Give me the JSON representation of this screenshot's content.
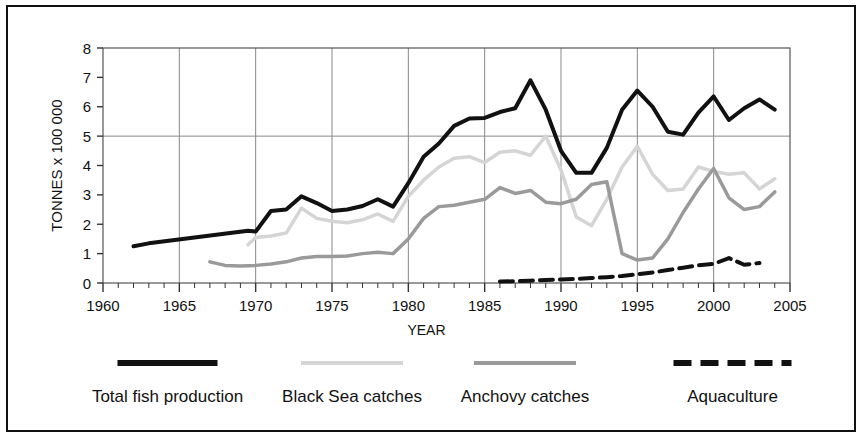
{
  "figure": {
    "border_color": "#111111",
    "background": "#ffffff"
  },
  "chart_data": {
    "type": "line",
    "title": "",
    "xlabel": "YEAR",
    "ylabel": "TONNES x 100 000",
    "xlim": [
      1960,
      2005
    ],
    "ylim": [
      0,
      8
    ],
    "xticks": [
      1960,
      1965,
      1970,
      1975,
      1980,
      1985,
      1990,
      1995,
      2000,
      2005
    ],
    "xtick_labels": [
      "1960",
      "1965",
      "1970",
      "1975",
      "1980",
      "1985",
      "1990",
      "1995",
      "2000",
      "2005"
    ],
    "x_minor_tick_step": 1,
    "yticks": [
      0,
      1,
      2,
      3,
      4,
      5,
      6,
      7,
      8
    ],
    "ytick_labels": [
      "0",
      "1",
      "2",
      "3",
      "4",
      "5",
      "6",
      "7",
      "8"
    ],
    "grid": {
      "vertical_at": [
        1965,
        1970,
        1975,
        1980,
        1985,
        1990,
        1995,
        2000
      ],
      "horizontal_at": [
        5
      ],
      "color": "#888888"
    },
    "legend_position": "below-plot",
    "series": [
      {
        "name": "Total fish production",
        "color": "#111111",
        "style": "solid",
        "width": 4,
        "points": [
          [
            1962,
            1.25
          ],
          [
            1963,
            1.35
          ],
          [
            1969.5,
            1.78
          ],
          [
            1970,
            1.75
          ],
          [
            1971,
            2.45
          ],
          [
            1972,
            2.5
          ],
          [
            1973,
            2.95
          ],
          [
            1974,
            2.72
          ],
          [
            1975,
            2.45
          ],
          [
            1976,
            2.5
          ],
          [
            1977,
            2.62
          ],
          [
            1978,
            2.85
          ],
          [
            1979,
            2.6
          ],
          [
            1980,
            3.4
          ],
          [
            1981,
            4.3
          ],
          [
            1982,
            4.75
          ],
          [
            1983,
            5.35
          ],
          [
            1984,
            5.6
          ],
          [
            1985,
            5.62
          ],
          [
            1986,
            5.82
          ],
          [
            1987,
            5.95
          ],
          [
            1988,
            6.9
          ],
          [
            1989,
            5.9
          ],
          [
            1990,
            4.5
          ],
          [
            1991,
            3.75
          ],
          [
            1992,
            3.75
          ],
          [
            1993,
            4.6
          ],
          [
            1994,
            5.9
          ],
          [
            1995,
            6.55
          ],
          [
            1996,
            6.0
          ],
          [
            1997,
            5.15
          ],
          [
            1998,
            5.05
          ],
          [
            1999,
            5.8
          ],
          [
            2000,
            6.35
          ],
          [
            2001,
            5.55
          ],
          [
            2002,
            5.95
          ],
          [
            2003,
            6.25
          ],
          [
            2004,
            5.9
          ]
        ]
      },
      {
        "name": "Black Sea catches",
        "color": "#d5d5d5",
        "style": "solid",
        "width": 3.5,
        "points": [
          [
            1969.5,
            1.3
          ],
          [
            1970,
            1.55
          ],
          [
            1971,
            1.6
          ],
          [
            1972,
            1.7
          ],
          [
            1973,
            2.55
          ],
          [
            1974,
            2.2
          ],
          [
            1975,
            2.1
          ],
          [
            1976,
            2.05
          ],
          [
            1977,
            2.15
          ],
          [
            1978,
            2.35
          ],
          [
            1979,
            2.1
          ],
          [
            1980,
            2.95
          ],
          [
            1981,
            3.5
          ],
          [
            1982,
            3.95
          ],
          [
            1983,
            4.25
          ],
          [
            1984,
            4.3
          ],
          [
            1985,
            4.1
          ],
          [
            1986,
            4.45
          ],
          [
            1987,
            4.5
          ],
          [
            1988,
            4.35
          ],
          [
            1989,
            5.0
          ],
          [
            1990,
            3.85
          ],
          [
            1991,
            2.25
          ],
          [
            1992,
            1.95
          ],
          [
            1993,
            2.85
          ],
          [
            1994,
            3.95
          ],
          [
            1995,
            4.65
          ],
          [
            1996,
            3.7
          ],
          [
            1997,
            3.15
          ],
          [
            1998,
            3.2
          ],
          [
            1999,
            3.95
          ],
          [
            2000,
            3.8
          ],
          [
            2001,
            3.7
          ],
          [
            2002,
            3.75
          ],
          [
            2003,
            3.2
          ],
          [
            2004,
            3.55
          ]
        ]
      },
      {
        "name": "Anchovy catches",
        "color": "#9a9a9a",
        "style": "solid",
        "width": 3.5,
        "points": [
          [
            1967,
            0.72
          ],
          [
            1968,
            0.6
          ],
          [
            1969,
            0.58
          ],
          [
            1970,
            0.6
          ],
          [
            1971,
            0.65
          ],
          [
            1972,
            0.72
          ],
          [
            1973,
            0.85
          ],
          [
            1974,
            0.9
          ],
          [
            1975,
            0.9
          ],
          [
            1976,
            0.92
          ],
          [
            1977,
            1.0
          ],
          [
            1978,
            1.05
          ],
          [
            1979,
            1.0
          ],
          [
            1980,
            1.5
          ],
          [
            1981,
            2.2
          ],
          [
            1982,
            2.6
          ],
          [
            1983,
            2.65
          ],
          [
            1984,
            2.75
          ],
          [
            1985,
            2.85
          ],
          [
            1986,
            3.25
          ],
          [
            1987,
            3.05
          ],
          [
            1988,
            3.15
          ],
          [
            1989,
            2.75
          ],
          [
            1990,
            2.7
          ],
          [
            1991,
            2.85
          ],
          [
            1992,
            3.35
          ],
          [
            1993,
            3.45
          ],
          [
            1994,
            1.0
          ],
          [
            1995,
            0.78
          ],
          [
            1996,
            0.85
          ],
          [
            1997,
            1.5
          ],
          [
            1998,
            2.4
          ],
          [
            1999,
            3.2
          ],
          [
            2000,
            3.9
          ],
          [
            2001,
            2.9
          ],
          [
            2002,
            2.5
          ],
          [
            2003,
            2.6
          ],
          [
            2004,
            3.1
          ]
        ]
      },
      {
        "name": "Aquaculture",
        "color": "#111111",
        "style": "dashed",
        "width": 4,
        "points": [
          [
            1986,
            0.05
          ],
          [
            1987,
            0.06
          ],
          [
            1988,
            0.08
          ],
          [
            1989,
            0.1
          ],
          [
            1990,
            0.12
          ],
          [
            1991,
            0.14
          ],
          [
            1992,
            0.17
          ],
          [
            1993,
            0.2
          ],
          [
            1994,
            0.24
          ],
          [
            1995,
            0.3
          ],
          [
            1996,
            0.36
          ],
          [
            1997,
            0.44
          ],
          [
            1998,
            0.52
          ],
          [
            1999,
            0.6
          ],
          [
            2000,
            0.65
          ],
          [
            2001,
            0.85
          ],
          [
            2002,
            0.62
          ],
          [
            2003,
            0.68
          ]
        ]
      }
    ]
  },
  "legend": {
    "items": [
      {
        "label": "Total fish production",
        "color": "#111111",
        "style": "solid"
      },
      {
        "label": "Black Sea catches",
        "color": "#d5d5d5",
        "style": "solid"
      },
      {
        "label": "Anchovy catches",
        "color": "#9a9a9a",
        "style": "solid"
      },
      {
        "label": "Aquaculture",
        "color": "#111111",
        "style": "dashed"
      }
    ]
  }
}
